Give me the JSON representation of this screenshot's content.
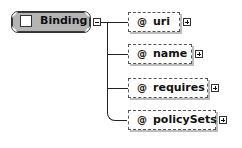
{
  "diagram": {
    "root": {
      "label": "Binding",
      "type": "element",
      "icon": "sequence-checkbox-icon",
      "toggle": "collapse",
      "fill_color": "#b4b4b4"
    },
    "children": [
      {
        "symbol": "@",
        "label": "uri",
        "type": "attribute",
        "toggle": "expand"
      },
      {
        "symbol": "@",
        "label": "name",
        "type": "attribute",
        "toggle": "expand"
      },
      {
        "symbol": "@",
        "label": "requires",
        "type": "attribute",
        "toggle": "expand"
      },
      {
        "symbol": "@",
        "label": "policySets",
        "type": "attribute",
        "toggle": "expand"
      }
    ]
  }
}
